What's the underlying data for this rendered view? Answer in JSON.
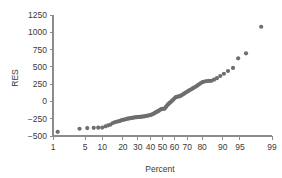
{
  "chart_data": {
    "type": "scatter",
    "title": "",
    "xlabel": "Percent",
    "ylabel": "RES",
    "x_scale": "normal-probability",
    "grid": false,
    "legend": "none",
    "xlim": [
      1,
      99
    ],
    "ylim": [
      -500,
      1250
    ],
    "xticks": [
      1,
      5,
      10,
      20,
      30,
      40,
      50,
      60,
      70,
      80,
      90,
      95,
      99
    ],
    "xtick_labels": [
      "1",
      "5",
      "10",
      "20",
      "30",
      "40",
      "50",
      "60",
      "70",
      "80",
      "90",
      "95",
      "99"
    ],
    "yticks": [
      -500,
      -250,
      0,
      250,
      500,
      750,
      1000,
      1250
    ],
    "ytick_labels": [
      "-500",
      "-250",
      "0",
      "250",
      "500",
      "750",
      "1000",
      "1250"
    ],
    "marker": "circle",
    "marker_color": "#6e6e6e",
    "marker_size": 2.1,
    "axis_color": "#8c8c8c",
    "text_color": "#3a3a3a",
    "background": "#ffffff",
    "n_points": 90,
    "points": [
      [
        1.3,
        -440
      ],
      [
        3.9,
        -395
      ],
      [
        5.5,
        -385
      ],
      [
        7.2,
        -382
      ],
      [
        8.6,
        -380
      ],
      [
        10.0,
        -378
      ],
      [
        11.3,
        -360
      ],
      [
        12.4,
        -345
      ],
      [
        13.5,
        -335
      ],
      [
        14.6,
        -312
      ],
      [
        15.7,
        -300
      ],
      [
        16.8,
        -292
      ],
      [
        17.9,
        -285
      ],
      [
        18.9,
        -275
      ],
      [
        19.9,
        -268
      ],
      [
        20.9,
        -262
      ],
      [
        21.9,
        -256
      ],
      [
        22.9,
        -250
      ],
      [
        23.9,
        -246
      ],
      [
        24.9,
        -242
      ],
      [
        25.9,
        -238
      ],
      [
        26.9,
        -234
      ],
      [
        27.9,
        -230
      ],
      [
        28.9,
        -228
      ],
      [
        29.9,
        -226
      ],
      [
        30.9,
        -224
      ],
      [
        31.9,
        -222
      ],
      [
        32.9,
        -220
      ],
      [
        33.9,
        -218
      ],
      [
        34.9,
        -215
      ],
      [
        35.9,
        -212
      ],
      [
        36.9,
        -208
      ],
      [
        37.9,
        -204
      ],
      [
        38.9,
        -200
      ],
      [
        39.9,
        -196
      ],
      [
        40.9,
        -190
      ],
      [
        41.9,
        -182
      ],
      [
        42.9,
        -172
      ],
      [
        43.9,
        -162
      ],
      [
        44.9,
        -152
      ],
      [
        45.9,
        -144
      ],
      [
        46.9,
        -136
      ],
      [
        47.9,
        -120
      ],
      [
        48.9,
        -112
      ],
      [
        49.9,
        -108
      ],
      [
        50.9,
        -106
      ],
      [
        51.9,
        -104
      ],
      [
        52.9,
        -80
      ],
      [
        53.9,
        -58
      ],
      [
        54.9,
        -40
      ],
      [
        55.9,
        -22
      ],
      [
        56.9,
        -8
      ],
      [
        57.9,
        8
      ],
      [
        58.9,
        24
      ],
      [
        59.9,
        42
      ],
      [
        60.9,
        58
      ],
      [
        61.9,
        66
      ],
      [
        62.9,
        70
      ],
      [
        63.9,
        74
      ],
      [
        64.9,
        80
      ],
      [
        65.9,
        92
      ],
      [
        66.9,
        104
      ],
      [
        67.9,
        116
      ],
      [
        68.9,
        128
      ],
      [
        69.9,
        140
      ],
      [
        70.9,
        152
      ],
      [
        71.9,
        164
      ],
      [
        72.9,
        176
      ],
      [
        73.9,
        188
      ],
      [
        74.9,
        200
      ],
      [
        75.9,
        212
      ],
      [
        76.9,
        228
      ],
      [
        77.9,
        244
      ],
      [
        79.0,
        262
      ],
      [
        80.2,
        278
      ],
      [
        81.4,
        288
      ],
      [
        82.6,
        294
      ],
      [
        83.8,
        296
      ],
      [
        85.0,
        298
      ],
      [
        86.3,
        314
      ],
      [
        87.6,
        336
      ],
      [
        89.0,
        368
      ],
      [
        90.4,
        400
      ],
      [
        91.8,
        440
      ],
      [
        93.3,
        484
      ],
      [
        94.6,
        624
      ],
      [
        96.2,
        696
      ],
      [
        98.2,
        1080
      ]
    ]
  }
}
